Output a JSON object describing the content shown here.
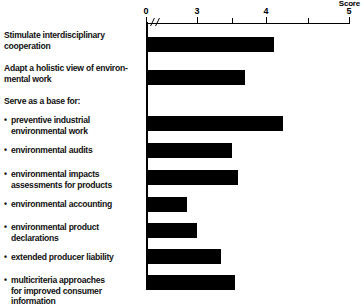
{
  "chart_data": {
    "type": "bar",
    "orientation": "horizontal",
    "title": "",
    "xlabel": "Score",
    "ylabel": "",
    "xlim": [
      0,
      5
    ],
    "axis_break": true,
    "axis_break_note": "axis broken between 0 and ~2.6",
    "grid": false,
    "legend": null,
    "tick_labels": [
      "0",
      "3",
      "4",
      "5"
    ],
    "tick_values": [
      0,
      3,
      4,
      5
    ],
    "minor_tick_values": [
      3.5,
      4.5
    ],
    "categories": [
      "Stimulate interdisciplinary cooperation",
      "Adapt a holistic view of environmental work",
      "preventive industrial environmental work",
      "environmental audits",
      "environmental impacts assessments for products",
      "environmental accounting",
      "environmental product declarations",
      "extended producer liability",
      "multicriteria approaches for improved consumer information"
    ],
    "values": [
      4.1,
      3.7,
      4.2,
      3.5,
      3.6,
      2.85,
      3.0,
      3.35,
      3.55
    ],
    "bar_color": "#000000"
  },
  "axis": {
    "score_label": "Score",
    "ticks": [
      {
        "label": "0",
        "value": 0
      },
      {
        "label": "3",
        "value": 3
      },
      {
        "label": "4",
        "value": 4
      },
      {
        "label": "5",
        "value": 5
      }
    ]
  },
  "rows": [
    {
      "label": "Stimulate interdisciplinary\ncooperation",
      "bullet": false,
      "value": 4.1,
      "has_bar": true
    },
    {
      "label": "Adapt a holistic view of environ-\nmental work",
      "bullet": false,
      "value": 3.7,
      "has_bar": true
    },
    {
      "label": "Serve as a base for:",
      "bullet": false,
      "value": null,
      "has_bar": false
    },
    {
      "label": "preventive industrial\nenvironmental work",
      "bullet": true,
      "value": 4.2,
      "has_bar": true
    },
    {
      "label": "environmental audits",
      "bullet": true,
      "value": 3.5,
      "has_bar": true
    },
    {
      "label": "environmental impacts\nassessments for products",
      "bullet": true,
      "value": 3.6,
      "has_bar": true
    },
    {
      "label": "environmental accounting",
      "bullet": true,
      "value": 2.85,
      "has_bar": true
    },
    {
      "label": "environmental product\ndeclarations",
      "bullet": true,
      "value": 3.0,
      "has_bar": true
    },
    {
      "label": "extended producer liability",
      "bullet": true,
      "value": 3.35,
      "has_bar": true
    },
    {
      "label": "multicriteria approaches\nfor improved consumer\ninformation",
      "bullet": true,
      "value": 3.55,
      "has_bar": true
    }
  ]
}
